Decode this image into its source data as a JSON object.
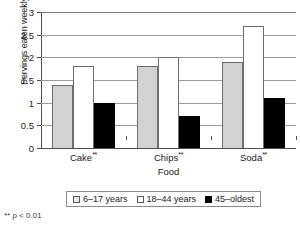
{
  "chart_data": {
    "type": "bar",
    "title": "",
    "xlabel": "Food",
    "ylabel": "Servings eaten weekly",
    "categories": [
      "Cake**",
      "Chips**",
      "Soda**"
    ],
    "series": [
      {
        "name": "6–17 years",
        "values": [
          1.4,
          1.8,
          1.9
        ],
        "color": "#d2d2d2"
      },
      {
        "name": "18–44 years",
        "values": [
          1.8,
          2.0,
          2.7
        ],
        "color": "#ffffff"
      },
      {
        "name": "45–oldest",
        "values": [
          1.0,
          0.7,
          1.1
        ],
        "color": "#000000"
      }
    ],
    "ylim": [
      0,
      3
    ],
    "yticks": [
      "0",
      "0.5",
      "1",
      "1.5",
      "2",
      "2.5",
      "3"
    ],
    "ytick_values": [
      0,
      0.5,
      1,
      1.5,
      2,
      2.5,
      3
    ],
    "grid": true,
    "legend_position": "bottom"
  },
  "footnote": "** p < 0.01"
}
